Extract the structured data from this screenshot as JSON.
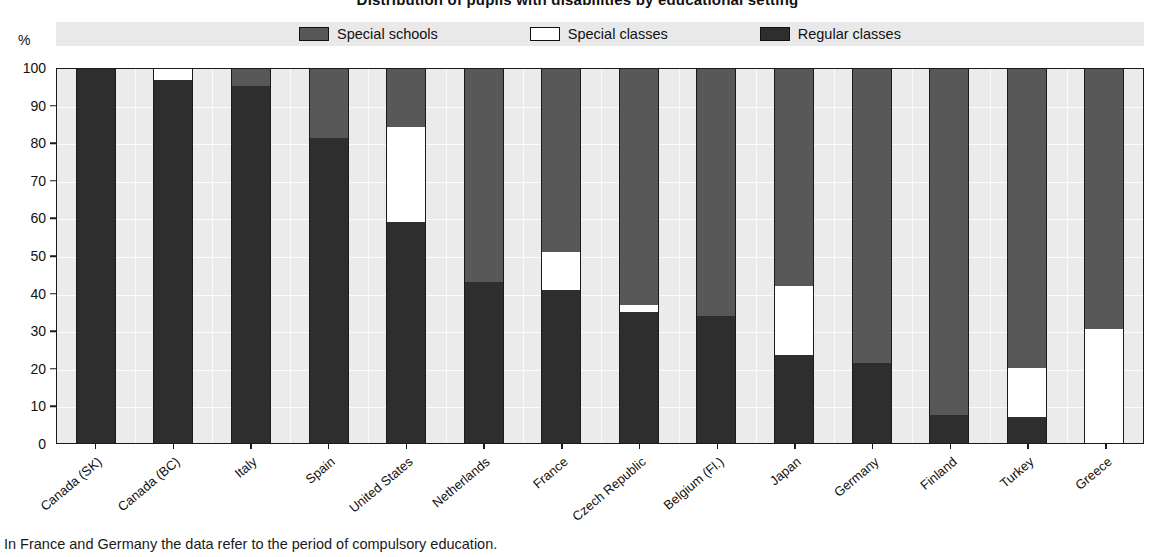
{
  "chart_data": {
    "type": "bar",
    "subtype": "stacked-100-percent-vertical",
    "title": "Distribution of pupils with disabilities by educational setting",
    "ylabel": "%",
    "xlabel": "",
    "ylim": [
      0,
      100
    ],
    "ytick_step": 10,
    "yticks": [
      "100",
      "90",
      "80",
      "70",
      "60",
      "50",
      "40",
      "30",
      "20",
      "10",
      "0"
    ],
    "grid": true,
    "legend_position": "top",
    "categories": [
      "Canada (SK)",
      "Canada (BC)",
      "Italy",
      "Spain",
      "United States",
      "Netherlands",
      "France",
      "Czech Republic",
      "Belgium (Fl.)",
      "Japan",
      "Germany",
      "Finland",
      "Turkey",
      "Greece"
    ],
    "series": [
      {
        "name": "Regular classes",
        "color": "#2e2e2e",
        "values": [
          100,
          97,
          95.5,
          81.5,
          59,
          43,
          41,
          35,
          34,
          23.5,
          21.5,
          7.5,
          7,
          0
        ]
      },
      {
        "name": "Special classes",
        "color": "#ffffff",
        "values": [
          0,
          3,
          0,
          0,
          25.5,
          0,
          10,
          2,
          0,
          18.5,
          0,
          0,
          13,
          30.5
        ]
      },
      {
        "name": "Special schools",
        "color": "#585858",
        "values": [
          0,
          0,
          4.5,
          18.5,
          15.5,
          57,
          49,
          63,
          66,
          58,
          78.5,
          92.5,
          80,
          69.5
        ]
      }
    ],
    "footnote": "In France and Germany the data refer to the period of compulsory education."
  },
  "legend": {
    "items": [
      {
        "label": "Special schools",
        "color": "#585858",
        "icon": "legend-swatch-icon"
      },
      {
        "label": "Special classes",
        "color": "#ffffff",
        "icon": "legend-swatch-icon"
      },
      {
        "label": "Regular classes",
        "color": "#2e2e2e",
        "icon": "legend-swatch-icon"
      }
    ]
  },
  "axis": {
    "y_unit": "%"
  }
}
